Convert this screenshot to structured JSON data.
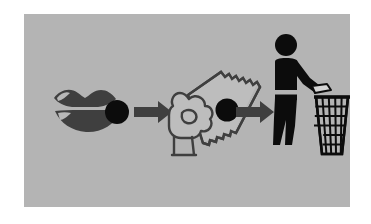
{
  "page": {
    "type": "pictogram-instruction-diagram",
    "background_color": "#ffffff",
    "panel_color": "#b4b4b4",
    "ink_color": "#3f3f3f",
    "accent_color": "#0c0c0c",
    "title": "",
    "caption": ""
  },
  "diagram": {
    "name": "take-medicine-then-dispose-sequence",
    "orientation": "left-to-right",
    "step_count": 3,
    "connector_count": 2,
    "steps": [
      {
        "index": 1,
        "name": "mouth-taking-tablet",
        "label": "",
        "icon": "lips-with-tablet-icon",
        "elements": [
          "upper-lip",
          "lower-lip",
          "lip-highlight",
          "tablet-circle"
        ],
        "color": "#3f3f3f",
        "tablet_color": "#0c0c0c"
      },
      {
        "index": 2,
        "name": "hand-holding-sachet",
        "label": "",
        "icon": "hand-holding-sachet-icon",
        "elements": [
          "hand-outline",
          "thumb",
          "wrist-cuff",
          "sachet-packet",
          "serrated-edge",
          "tablet-circle"
        ],
        "color": "#3f3f3f",
        "tablet_color": "#0c0c0c"
      },
      {
        "index": 3,
        "name": "dispose-in-bin",
        "label": "",
        "icon": "person-litter-bin-icon",
        "elements": [
          "head",
          "torso",
          "waist-band",
          "arm",
          "legs",
          "litter-piece",
          "wire-mesh-bin",
          "bin-rim"
        ],
        "color": "#0c0c0c",
        "bin_color": "#0c0c0c"
      }
    ],
    "connectors": [
      {
        "index": 1,
        "name": "arrow-step1-to-step2",
        "direction": "right",
        "color": "#3f3f3f"
      },
      {
        "index": 2,
        "name": "arrow-step2-to-step3",
        "direction": "right",
        "color": "#3f3f3f"
      }
    ]
  }
}
